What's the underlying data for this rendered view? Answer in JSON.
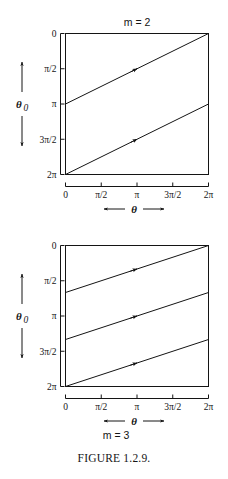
{
  "figure": {
    "caption": "FIGURE 1.2.9.",
    "axis_labels": {
      "x": "θ",
      "y": "θ",
      "y_sub": "0"
    },
    "tick_labels": {
      "x": [
        "0",
        "π/2",
        "π",
        "3π/2",
        "2π"
      ],
      "y": [
        "0",
        "π/2",
        "π",
        "3π/2",
        "2π"
      ]
    },
    "panels": [
      {
        "title": "m = 2",
        "title_position": "top"
      },
      {
        "title": "m = 3",
        "title_position": "bottom"
      }
    ]
  },
  "chart_data": [
    {
      "type": "line",
      "title": "m = 2",
      "xlabel": "θ",
      "ylabel": "θ₀",
      "xlim": [
        0,
        6.283185
      ],
      "ylim": [
        6.283185,
        0
      ],
      "y_axis_inverted": true,
      "grid": false,
      "legend": "none",
      "xticks": [
        0,
        1.570796,
        3.141593,
        4.712389,
        6.283185
      ],
      "xticklabels": [
        "0",
        "π/2",
        "π",
        "3π/2",
        "2π"
      ],
      "yticks": [
        0,
        1.570796,
        3.141593,
        4.712389,
        6.283185
      ],
      "yticklabels": [
        "0",
        "π/2",
        "π",
        "3π/2",
        "2π"
      ],
      "series": [
        {
          "name": "branch-1",
          "x": [
            0,
            6.283185
          ],
          "y": [
            3.141593,
            0
          ],
          "arrow": true,
          "arrow_at_x": 3.141593
        },
        {
          "name": "branch-2",
          "x": [
            0,
            6.283185
          ],
          "y": [
            6.283185,
            3.141593
          ],
          "arrow": true,
          "arrow_at_x": 3.141593
        }
      ]
    },
    {
      "type": "line",
      "title": "m = 3",
      "xlabel": "θ",
      "ylabel": "θ₀",
      "xlim": [
        0,
        6.283185
      ],
      "ylim": [
        6.283185,
        0
      ],
      "y_axis_inverted": true,
      "grid": false,
      "legend": "none",
      "xticks": [
        0,
        1.570796,
        3.141593,
        4.712389,
        6.283185
      ],
      "xticklabels": [
        "0",
        "π/2",
        "π",
        "3π/2",
        "2π"
      ],
      "yticks": [
        0,
        1.570796,
        3.141593,
        4.712389,
        6.283185
      ],
      "yticklabels": [
        "0",
        "π/2",
        "π",
        "3π/2",
        "2π"
      ],
      "series": [
        {
          "name": "branch-1",
          "x": [
            0,
            6.283185
          ],
          "y": [
            2.094395,
            0
          ],
          "arrow": true,
          "arrow_at_x": 3.141593
        },
        {
          "name": "branch-2",
          "x": [
            0,
            6.283185
          ],
          "y": [
            4.18879,
            2.094395
          ],
          "arrow": true,
          "arrow_at_x": 3.141593
        },
        {
          "name": "branch-3",
          "x": [
            0,
            6.283185
          ],
          "y": [
            6.283185,
            4.18879
          ],
          "arrow": true,
          "arrow_at_x": 3.141593
        }
      ]
    }
  ],
  "colors": {
    "ink": "#141414",
    "background": "#ffffff"
  }
}
